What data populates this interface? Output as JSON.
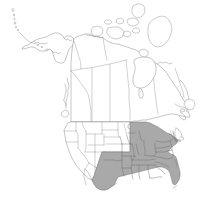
{
  "figure": {
    "kind": "distribution-range-map",
    "title": "",
    "caption": "",
    "region": "North America",
    "background_color": "#ffffff",
    "width": 216,
    "height": 203
  },
  "legend": {
    "present": false,
    "entries": [
      {
        "label": "",
        "swatch_color": "#a9a9a9",
        "meaning": "shaded range"
      },
      {
        "label": "",
        "swatch_color": "#ffffff",
        "meaning": "outside range"
      }
    ]
  },
  "styles": {
    "range_fill": "#a9a9a9",
    "range_stroke": "#6e6e6e",
    "land_fill": "#ffffff",
    "land_stroke": "#8c8c8c",
    "subdivision_stroke": "#9a9a9a",
    "coast_detail_stroke": "#7a7a7a"
  },
  "map": {
    "countries": [
      {
        "name": "Canada",
        "shaded": false
      },
      {
        "name": "United States",
        "shaded": "partial"
      },
      {
        "name": "Mexico",
        "shaded": false
      },
      {
        "name": "Greenland",
        "shaded": false
      }
    ],
    "shaded_regions": [
      "Texas",
      "Oklahoma",
      "Kansas",
      "Missouri",
      "Arkansas",
      "Louisiana",
      "Mississippi",
      "Alabama",
      "Georgia",
      "Florida",
      "South Carolina",
      "North Carolina",
      "Tennessee",
      "Kentucky",
      "Virginia",
      "West Virginia",
      "Maryland",
      "Delaware",
      "New Jersey",
      "Pennsylvania",
      "Ohio",
      "Indiana",
      "Illinois",
      "Iowa",
      "Nebraska",
      "New York",
      "Connecticut",
      "Rhode Island",
      "Massachusetts",
      "Michigan"
    ],
    "unshaded_regions": [
      "Alaska",
      "Washington",
      "Oregon",
      "California",
      "Nevada",
      "Idaho",
      "Montana",
      "Wyoming",
      "Utah",
      "Arizona",
      "New Mexico",
      "Colorado",
      "North Dakota",
      "South Dakota",
      "Minnesota",
      "Wisconsin",
      "Maine",
      "New Hampshire",
      "Vermont",
      "British Columbia",
      "Alberta",
      "Saskatchewan",
      "Manitoba",
      "Ontario",
      "Quebec",
      "Newfoundland",
      "Yukon",
      "Northwest Territories",
      "Nunavut"
    ],
    "features": [
      {
        "name": "Aleutian Islands",
        "type": "island-chain"
      },
      {
        "name": "Great Lakes",
        "type": "lakes"
      },
      {
        "name": "Hudson Bay",
        "type": "bay"
      },
      {
        "name": "Canadian Arctic Archipelago",
        "type": "island-chain"
      },
      {
        "name": "Baffin Island",
        "type": "island"
      },
      {
        "name": "Newfoundland",
        "type": "island"
      },
      {
        "name": "Vancouver Island",
        "type": "island"
      },
      {
        "name": "Florida Peninsula",
        "type": "peninsula"
      },
      {
        "name": "Gulf of Mexico",
        "type": "gulf"
      }
    ]
  }
}
